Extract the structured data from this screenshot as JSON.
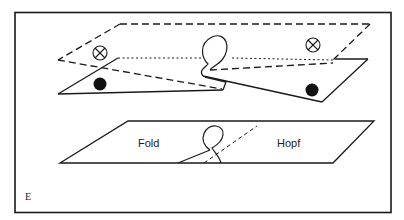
{
  "figure": {
    "panel_letter": "E",
    "colors": {
      "ink": "#1a1a1a",
      "background": "#ffffff"
    },
    "upper_surface": {
      "description": "folded sheet with dashed upper sheet and solid lower sheets",
      "markers": [
        {
          "type": "crossed-circle",
          "name": "unstable-marker-left"
        },
        {
          "type": "crossed-circle",
          "name": "unstable-marker-right"
        },
        {
          "type": "filled-dot",
          "name": "stable-marker-left"
        },
        {
          "type": "filled-dot",
          "name": "stable-marker-right"
        }
      ]
    },
    "lower_plane": {
      "left_label": "Fold",
      "right_label": "Hopf"
    }
  }
}
